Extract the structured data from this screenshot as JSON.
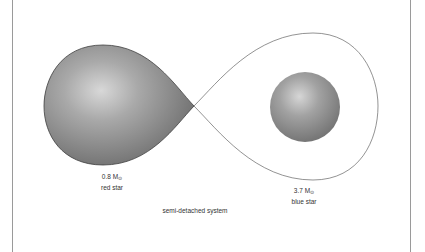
{
  "diagram": {
    "caption": "semi-detached system",
    "colors": {
      "frame": "#9a9a9a",
      "outline": "#4a4a4a",
      "star_dark": "#6e6e6e",
      "star_light": "#d4d4d4"
    },
    "red_star": {
      "mass": "0.8 M",
      "mass_symbol": "⊙",
      "name": "red star"
    },
    "blue_star": {
      "mass": "3.7 M",
      "mass_symbol": "⊙",
      "name": "blue star"
    }
  }
}
